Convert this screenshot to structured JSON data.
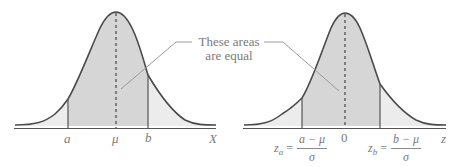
{
  "figure": {
    "colors": {
      "curve": "#4a4a4a",
      "axis": "#555555",
      "center_fill": "#d6d6d6",
      "tail_fill": "#ececec",
      "label": "#7a7a7a",
      "leader_line": "#9a9a9a"
    },
    "left_panel": {
      "name": "Normal distribution of X",
      "axis_label": "X",
      "ticks": [
        {
          "label": "a",
          "x": 68
        },
        {
          "label": "μ",
          "x": 116
        },
        {
          "label": "b",
          "x": 148
        }
      ]
    },
    "right_panel": {
      "name": "Standard normal distribution of z",
      "axis_label": "z",
      "center_tick": "0",
      "za": {
        "lhs": "z",
        "sub": "a",
        "eq": "=",
        "num": "a − μ",
        "den": "σ"
      },
      "zb": {
        "lhs": "z",
        "sub": "b",
        "eq": "=",
        "num": "b − μ",
        "den": "σ"
      }
    },
    "callout": {
      "line1": "These areas",
      "line2": "are equal"
    }
  }
}
